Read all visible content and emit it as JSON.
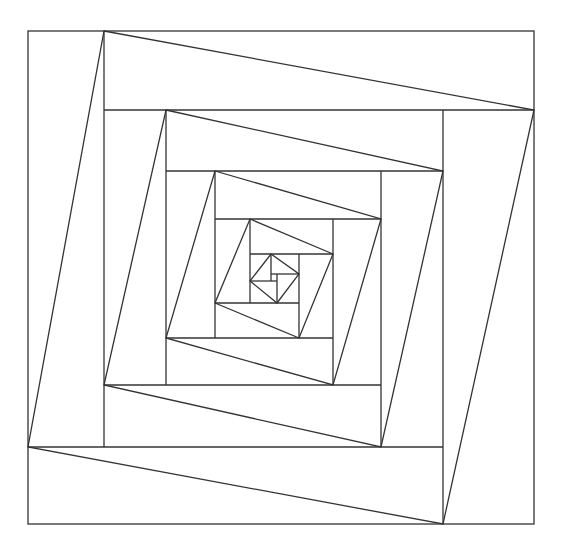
{
  "diagram": {
    "title": "",
    "stroke_color": "#333333",
    "background": "#ffffff",
    "levels": [
      {
        "box": [
          28,
          31,
          534,
          524
        ],
        "rotated": [
          [
            104,
            31
          ],
          [
            534,
            110
          ],
          [
            443,
            524
          ],
          [
            28,
            447
          ]
        ],
        "dividers": [
          [
            104,
            31,
            104,
            447
          ],
          [
            104,
            110,
            534,
            110
          ],
          [
            443,
            110,
            443,
            524
          ],
          [
            28,
            447,
            443,
            447
          ]
        ]
      },
      {
        "box": [
          104,
          110,
          443,
          447
        ],
        "rotated": [
          [
            166,
            110
          ],
          [
            443,
            171
          ],
          [
            381,
            447
          ],
          [
            104,
            385
          ]
        ],
        "dividers": [
          [
            166,
            110,
            166,
            385
          ],
          [
            166,
            171,
            443,
            171
          ],
          [
            381,
            171,
            381,
            447
          ],
          [
            104,
            385,
            381,
            385
          ]
        ]
      },
      {
        "box": [
          166,
          171,
          381,
          385
        ],
        "rotated": [
          [
            215,
            171
          ],
          [
            381,
            219
          ],
          [
            333,
            385
          ],
          [
            166,
            338
          ]
        ],
        "dividers": [
          [
            215,
            171,
            215,
            338
          ],
          [
            215,
            219,
            381,
            219
          ],
          [
            333,
            219,
            333,
            385
          ],
          [
            166,
            338,
            333,
            338
          ]
        ]
      },
      {
        "box": [
          215,
          219,
          333,
          338
        ],
        "rotated": [
          [
            250,
            219
          ],
          [
            333,
            254
          ],
          [
            299,
            338
          ],
          [
            215,
            303
          ]
        ],
        "dividers": [
          [
            250,
            219,
            250,
            303
          ],
          [
            250,
            254,
            333,
            254
          ],
          [
            299,
            254,
            299,
            338
          ],
          [
            215,
            303,
            299,
            303
          ]
        ]
      },
      {
        "box": [
          250,
          254,
          299,
          303
        ],
        "rotated": [
          [
            271,
            254
          ],
          [
            299,
            274
          ],
          [
            277,
            303
          ],
          [
            250,
            281
          ]
        ],
        "dividers": [
          [
            271,
            254,
            271,
            281
          ],
          [
            271,
            274,
            299,
            274
          ],
          [
            277,
            274,
            277,
            303
          ],
          [
            250,
            281,
            277,
            281
          ]
        ]
      }
    ]
  }
}
